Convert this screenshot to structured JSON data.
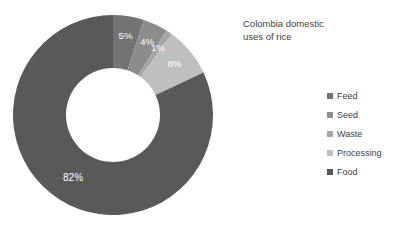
{
  "chart_data": {
    "type": "pie",
    "variant": "donut",
    "title": "Colombia domestic\nuses of rice",
    "xlabel": "",
    "ylabel": "",
    "grid": false,
    "legend_position": "right",
    "start_angle_deg": 0,
    "direction": "clockwise",
    "background": "#ffffff",
    "categories": [
      "Feed",
      "Seed",
      "Waste",
      "Processing",
      "Food"
    ],
    "values": [
      5,
      4,
      1,
      8,
      82
    ],
    "unit": "%",
    "data_labels": [
      "5%",
      "4%",
      "1%",
      "8%",
      "82%"
    ],
    "colors": [
      "#737373",
      "#8c8c8c",
      "#a6a6a6",
      "#bfbfbf",
      "#595959"
    ],
    "label_color": "#ffffff",
    "slices": [
      {
        "name": "Feed",
        "value": 5,
        "label": "5%",
        "color": "#737373"
      },
      {
        "name": "Seed",
        "value": 4,
        "label": "4%",
        "color": "#8c8c8c"
      },
      {
        "name": "Waste",
        "value": 1,
        "label": "1%",
        "color": "#a6a6a6"
      },
      {
        "name": "Processing",
        "value": 8,
        "label": "8%",
        "color": "#bfbfbf"
      },
      {
        "name": "Food",
        "value": 82,
        "label": "82%",
        "color": "#595959"
      }
    ]
  },
  "title": {
    "text": "Colombia domestic\nuses of rice"
  },
  "legend": {
    "items": [
      {
        "label": "Feed",
        "color": "#737373"
      },
      {
        "label": "Seed",
        "color": "#8c8c8c"
      },
      {
        "label": "Waste",
        "color": "#a6a6a6"
      },
      {
        "label": "Processing",
        "color": "#bfbfbf"
      },
      {
        "label": "Food",
        "color": "#595959"
      }
    ]
  }
}
